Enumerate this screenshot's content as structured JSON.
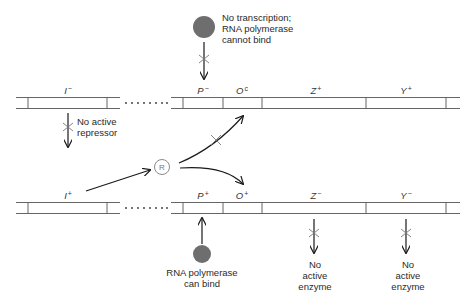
{
  "colors": {
    "line": "#555555",
    "arrow": "#1a1a1a",
    "polymerase": "#6e6e6e",
    "repressor_ring": "#8a8a8a",
    "text": "#2a2a2a"
  },
  "top_strand": {
    "label": "mutant (I- P-)",
    "genes": [
      {
        "name": "I",
        "sup": "−",
        "x": 68
      },
      {
        "name": "P",
        "sup": "−",
        "x": 203
      },
      {
        "name": "O",
        "sup": "c",
        "x": 242
      },
      {
        "name": "Z",
        "sup": "+",
        "x": 316
      },
      {
        "name": "Y",
        "sup": "+",
        "x": 406
      }
    ]
  },
  "bottom_strand": {
    "label": "wild-type (I+ P+)",
    "genes": [
      {
        "name": "I",
        "sup": "+",
        "x": 68
      },
      {
        "name": "P",
        "sup": "+",
        "x": 203
      },
      {
        "name": "O",
        "sup": "+",
        "x": 242
      },
      {
        "name": "Z",
        "sup": "−",
        "x": 316
      },
      {
        "name": "Y",
        "sup": "−",
        "x": 406
      }
    ]
  },
  "annotations": {
    "no_transcription": [
      "No transcription;",
      "RNA polymerase",
      "cannot bind"
    ],
    "no_active_repressor": [
      "No active",
      "repressor"
    ],
    "polymerase_can_bind": [
      "RNA polymerase",
      "can bind"
    ],
    "no_active_enzyme_z": [
      "No",
      "active",
      "enzyme"
    ],
    "no_active_enzyme_y": [
      "No",
      "active",
      "enzyme"
    ]
  },
  "repressor": {
    "label": "R"
  },
  "dots": "........"
}
